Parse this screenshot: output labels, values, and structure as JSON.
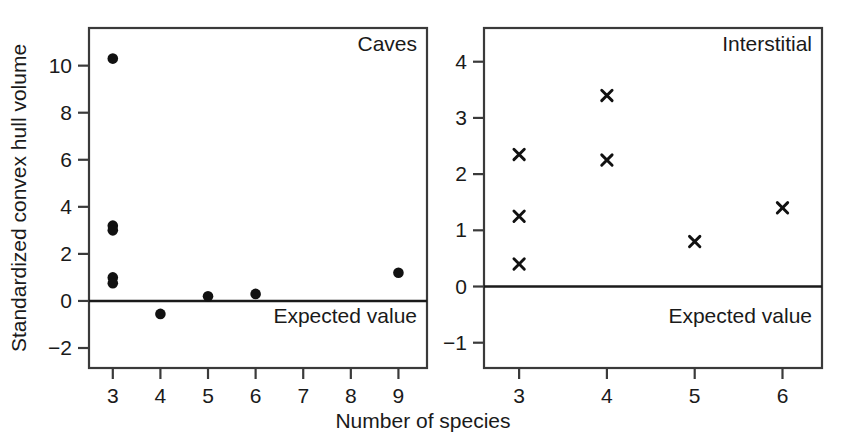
{
  "figure": {
    "xlabel": "Number of species",
    "ylabel": "Standardized convex hull volume",
    "expected_value_label": "Expected value"
  },
  "chart_data": [
    {
      "type": "scatter",
      "title": "Caves",
      "panel": "left",
      "marker": "filled-circle",
      "xlabel": "Number of species",
      "ylabel": "Standardized convex hull volume",
      "xlim": [
        2.5,
        9.6
      ],
      "ylim": [
        -2.85,
        11.6
      ],
      "xticks": [
        3,
        4,
        5,
        6,
        7,
        8,
        9
      ],
      "xticklabels": [
        "3",
        "4",
        "5",
        "6",
        "7",
        "8",
        "9"
      ],
      "yticks": [
        -2,
        0,
        2,
        4,
        6,
        8,
        10
      ],
      "yticklabels": [
        "−2",
        "0",
        "2",
        "4",
        "6",
        "8",
        "10"
      ],
      "grid": false,
      "reference_line": {
        "y": 0,
        "label": "Expected value"
      },
      "points": [
        {
          "x": 3,
          "y": 10.3
        },
        {
          "x": 3,
          "y": 3.2
        },
        {
          "x": 3,
          "y": 3.0
        },
        {
          "x": 3,
          "y": 1.0
        },
        {
          "x": 3,
          "y": 0.75
        },
        {
          "x": 4,
          "y": -0.55
        },
        {
          "x": 5,
          "y": 0.2
        },
        {
          "x": 6,
          "y": 0.3
        },
        {
          "x": 9,
          "y": 1.2
        }
      ]
    },
    {
      "type": "scatter",
      "title": "Interstitial",
      "panel": "right",
      "marker": "cross",
      "xlabel": "Number of species",
      "ylabel": "Standardized convex hull volume",
      "xlim": [
        2.6,
        6.45
      ],
      "ylim": [
        -1.45,
        4.6
      ],
      "xticks": [
        3,
        4,
        5,
        6
      ],
      "xticklabels": [
        "3",
        "4",
        "5",
        "6"
      ],
      "yticks": [
        -1,
        0,
        1,
        2,
        3,
        4
      ],
      "yticklabels": [
        "−1",
        "0",
        "1",
        "2",
        "3",
        "4"
      ],
      "grid": false,
      "reference_line": {
        "y": 0,
        "label": "Expected value"
      },
      "points": [
        {
          "x": 3,
          "y": 2.35
        },
        {
          "x": 3,
          "y": 1.25
        },
        {
          "x": 3,
          "y": 0.4
        },
        {
          "x": 4,
          "y": 3.4
        },
        {
          "x": 4,
          "y": 2.25
        },
        {
          "x": 5,
          "y": 0.8
        },
        {
          "x": 6,
          "y": 1.4
        }
      ]
    }
  ]
}
